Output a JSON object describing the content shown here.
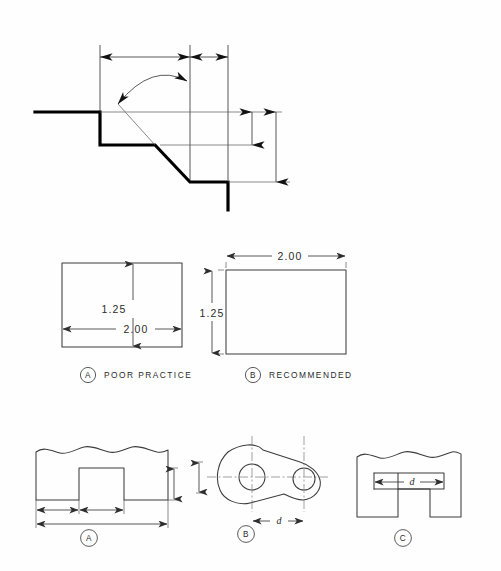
{
  "page": {
    "background_color": "#fefefe",
    "line_color": "#000000",
    "dimension_color": "#2e2e2e",
    "width": 501,
    "height": 571
  },
  "figures": {
    "top": {
      "name": "chamfer-angle-dimension-figure",
      "description": "Stepped profile with chamfer, angular arc dimension and two vertical size dimensions",
      "labels": []
    },
    "middle": {
      "name": "rectangle-comparison-row",
      "items": [
        {
          "bubble": "A",
          "caption": "POOR PRACTICE",
          "dimensions": [
            {
              "value": "1.25",
              "orientation": "vertical",
              "placement": "inside"
            },
            {
              "value": "2.00",
              "orientation": "horizontal",
              "placement": "inside"
            }
          ]
        },
        {
          "bubble": "B",
          "caption": "RECOMMENDED",
          "dimensions": [
            {
              "value": "2.00",
              "orientation": "horizontal",
              "placement": "outside-top"
            },
            {
              "value": "1.25",
              "orientation": "vertical",
              "placement": "outside-left"
            }
          ]
        }
      ]
    },
    "bottom": {
      "name": "dimension-placement-row",
      "items": [
        {
          "bubble": "A",
          "shape": "slotted-block-with-break-line",
          "dimensions": [
            {
              "value": "",
              "orientation": "horizontal",
              "placement": "below-inner"
            },
            {
              "value": "",
              "orientation": "horizontal",
              "placement": "below-overall"
            },
            {
              "value": "",
              "orientation": "vertical",
              "placement": "right"
            }
          ]
        },
        {
          "bubble": "B",
          "shape": "two-hole-link",
          "dimensions": [
            {
              "value": "d",
              "orientation": "horizontal",
              "placement": "below-centers"
            },
            {
              "value": "",
              "orientation": "vertical",
              "placement": "left"
            }
          ]
        },
        {
          "bubble": "C",
          "shape": "t-slot-block-with-break-line",
          "dimensions": [
            {
              "value": "d",
              "orientation": "horizontal",
              "placement": "inside-slot"
            }
          ]
        }
      ]
    }
  }
}
